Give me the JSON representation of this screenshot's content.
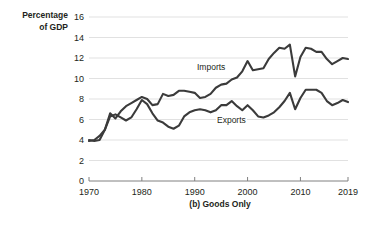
{
  "figure": {
    "caption": "(b) Goods Only",
    "axis_title": "Percentage\nof GDP",
    "background_color": "#ffffff",
    "line_color": "#3b3b3b",
    "grid_color": "#d9d9d9",
    "axis_color": "#808080"
  },
  "chart_data": {
    "type": "line",
    "title": "",
    "subtitle": "",
    "caption": "(b) Goods Only",
    "xlabel": "",
    "ylabel": "Percentage of GDP",
    "xlim": [
      1970,
      2019
    ],
    "ylim": [
      0,
      16
    ],
    "ytick_labels": [
      "0",
      "2",
      "4",
      "6",
      "8",
      "10",
      "12",
      "14",
      "16"
    ],
    "yticks": [
      0,
      2,
      4,
      6,
      8,
      10,
      12,
      14,
      16
    ],
    "xtick_labels": [
      "1970",
      "1980",
      "1990",
      "2000",
      "2010",
      "2019"
    ],
    "xticks": [
      1970,
      1980,
      1990,
      2000,
      2010,
      2019
    ],
    "grid": "horizontal",
    "legend_position": "inline-annotations",
    "x": [
      1970,
      1971,
      1972,
      1973,
      1974,
      1975,
      1976,
      1977,
      1978,
      1979,
      1980,
      1981,
      1982,
      1983,
      1984,
      1985,
      1986,
      1987,
      1988,
      1989,
      1990,
      1991,
      1992,
      1993,
      1994,
      1995,
      1996,
      1997,
      1998,
      1999,
      2000,
      2001,
      2002,
      2003,
      2004,
      2005,
      2006,
      2007,
      2008,
      2009,
      2010,
      2011,
      2012,
      2013,
      2014,
      2015,
      2016,
      2017,
      2018,
      2019
    ],
    "series": [
      {
        "name": "Imports",
        "color": "#3b3b3b",
        "label_x": 1997,
        "label_y": 10.0,
        "values": [
          3.9,
          4.0,
          4.4,
          5.0,
          6.6,
          6.1,
          6.8,
          7.3,
          7.6,
          7.9,
          8.2,
          8.0,
          7.4,
          7.5,
          8.5,
          8.3,
          8.4,
          8.8,
          8.8,
          8.7,
          8.6,
          8.1,
          8.2,
          8.5,
          9.1,
          9.4,
          9.5,
          9.9,
          10.1,
          10.7,
          11.7,
          10.8,
          10.9,
          11.0,
          11.9,
          12.5,
          13.0,
          12.9,
          13.3,
          10.2,
          12.1,
          13.0,
          12.9,
          12.6,
          12.6,
          11.9,
          11.4,
          11.7,
          12.0,
          11.9
        ]
      },
      {
        "name": "Exports",
        "color": "#3b3b3b",
        "label_x": 2000,
        "label_y": 6.3,
        "values": [
          4.0,
          3.9,
          4.0,
          5.0,
          6.3,
          6.5,
          6.2,
          5.9,
          6.2,
          7.0,
          7.9,
          7.5,
          6.6,
          5.9,
          5.7,
          5.3,
          5.1,
          5.4,
          6.3,
          6.7,
          6.9,
          7.0,
          6.9,
          6.7,
          6.9,
          7.4,
          7.4,
          7.8,
          7.3,
          6.9,
          7.4,
          6.9,
          6.3,
          6.2,
          6.4,
          6.7,
          7.2,
          7.8,
          8.6,
          7.0,
          8.1,
          8.9,
          8.9,
          8.9,
          8.6,
          7.8,
          7.4,
          7.6,
          7.9,
          7.7
        ]
      }
    ]
  },
  "y_tick_labels": [
    {
      "label": "16",
      "value": 16
    },
    {
      "label": "14",
      "value": 14
    },
    {
      "label": "12",
      "value": 12
    },
    {
      "label": "10",
      "value": 10
    },
    {
      "label": "8",
      "value": 8
    },
    {
      "label": "6",
      "value": 6
    },
    {
      "label": "4",
      "value": 4
    },
    {
      "label": "2",
      "value": 2
    },
    {
      "label": "0",
      "value": 0
    }
  ],
  "x_tick_labels": [
    {
      "label": "1970",
      "value": 1970
    },
    {
      "label": "1980",
      "value": 1980
    },
    {
      "label": "1990",
      "value": 1990
    },
    {
      "label": "2000",
      "value": 2000
    },
    {
      "label": "2010",
      "value": 2010
    },
    {
      "label": "2019",
      "value": 2019
    }
  ],
  "annotations": [
    {
      "name": "imports-label",
      "text": "Imports"
    },
    {
      "name": "exports-label",
      "text": "Exports"
    }
  ]
}
